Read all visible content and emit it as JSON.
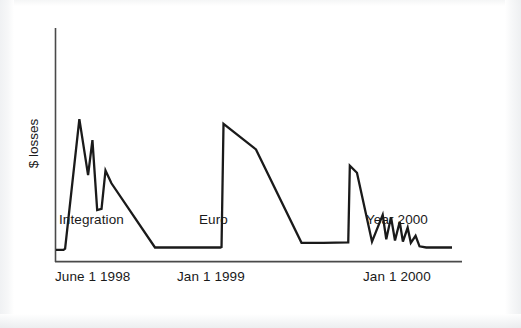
{
  "figure": {
    "background_color": "#ffffff",
    "line_color": "#1a1a1a",
    "axis_color": "#4a4a4a",
    "text_color": "#1a1a1a"
  },
  "axes": {
    "y_axis_label": "$ losses",
    "x_tick_labels": [
      "June 1 1998",
      "Jan 1 1999",
      "Jan 1 2000"
    ]
  },
  "annotations": [
    {
      "label": "Integration"
    },
    {
      "label": "Euro"
    },
    {
      "label": "Year 2000"
    }
  ],
  "chart_data": {
    "type": "line",
    "title": "",
    "xlabel": "",
    "ylabel": "$ losses",
    "grid": false,
    "legend": "none",
    "xlim": [
      0,
      100
    ],
    "ylim": [
      0,
      100
    ],
    "x_tick_positions": [
      6,
      42,
      78
    ],
    "x_tick_labels": [
      "June 1 1998",
      "Jan 1 1999",
      "Jan 1 2000"
    ],
    "annotations": [
      {
        "text": "Integration",
        "x": 6,
        "y": -12
      },
      {
        "text": "Euro",
        "x": 42,
        "y": -12
      },
      {
        "text": "Year 2000",
        "x": 78,
        "y": -12
      }
    ],
    "series": [
      {
        "name": "$ losses",
        "x": [
          0.0,
          1.9,
          2.3,
          5.9,
          8.1,
          9.2,
          10.4,
          11.5,
          12.5,
          14.0,
          25.0,
          41.5,
          41.8,
          42.3,
          50.5,
          62.0,
          67.5,
          73.8,
          74.2,
          76.0,
          79.8,
          82.5,
          83.4,
          84.6,
          85.6,
          86.8,
          87.6,
          88.8,
          89.6,
          90.8,
          91.8,
          93.5,
          100.0
        ],
        "y": [
          5.0,
          5.0,
          5.5,
          61.0,
          37.0,
          52.0,
          22.0,
          22.5,
          39.0,
          33.5,
          6.0,
          6.0,
          6.2,
          59.0,
          48.0,
          8.0,
          8.0,
          8.2,
          41.0,
          38.0,
          8.5,
          20.0,
          9.5,
          19.0,
          9.0,
          17.0,
          8.5,
          14.5,
          8.0,
          11.0,
          6.5,
          6.0,
          6.0
        ]
      }
    ]
  }
}
